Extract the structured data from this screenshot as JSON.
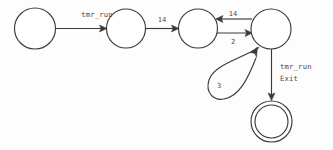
{
  "diagram": {
    "type": "finite-state-machine",
    "background_color": "#fdfdfd",
    "stroke_color": "#3a3a3a",
    "label_color": "#4a4a4a",
    "states": [
      {
        "id": "s1",
        "label": "",
        "kind": "normal",
        "cx": 35,
        "cy": 28.5,
        "r": 20.5
      },
      {
        "id": "s2",
        "label": "",
        "kind": "normal",
        "cx": 126,
        "cy": 28.5,
        "r": 19.5
      },
      {
        "id": "s3",
        "label": "",
        "kind": "normal",
        "cx": 198,
        "cy": 28.5,
        "r": 19.5
      },
      {
        "id": "s4",
        "label": "",
        "kind": "normal",
        "cx": 271,
        "cy": 29.0,
        "r": 20.0
      },
      {
        "id": "s5",
        "label": "",
        "kind": "accepting",
        "cx": 271.5,
        "cy": 121.5,
        "r": 20.5
      }
    ],
    "transitions": [
      {
        "id": "t1",
        "from": "s1",
        "to": "s2",
        "label": "tmr_run",
        "label_x": 97,
        "label_y": 17,
        "direction": "right"
      },
      {
        "id": "t2",
        "from": "s2",
        "to": "s3",
        "label": "14",
        "label_x": 162,
        "label_y": 22,
        "direction": "right"
      },
      {
        "id": "t3",
        "from": "s4",
        "to": "s3",
        "label": "14",
        "label_x": 233,
        "label_y": 16,
        "direction": "left"
      },
      {
        "id": "t4",
        "from": "s3",
        "to": "s4",
        "label": "2",
        "label_x": 233,
        "label_y": 44,
        "direction": "right"
      },
      {
        "id": "t5",
        "from": "s4",
        "to": "s4",
        "label": "3",
        "label_x": 219,
        "label_y": 88,
        "direction": "self-loop"
      },
      {
        "id": "t6",
        "from": "s4",
        "to": "s5",
        "label": "tmr_run",
        "label2": "Exit",
        "label_x": 280,
        "label_y": 69,
        "label2_y": 81,
        "direction": "down"
      }
    ]
  }
}
